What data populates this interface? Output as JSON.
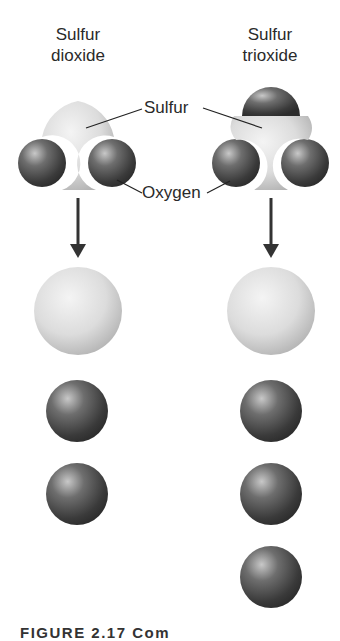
{
  "figure": {
    "molecules": [
      {
        "name_line1": "Sulfur",
        "name_line2": "dioxide",
        "sulfur_atoms": 1,
        "oxygen_atoms": 2
      },
      {
        "name_line1": "Sulfur",
        "name_line2": "trioxide",
        "sulfur_atoms": 1,
        "oxygen_atoms": 3
      }
    ],
    "labels": {
      "sulfur": "Sulfur",
      "oxygen": "Oxygen"
    },
    "caption": "FIGURE 2.17  Com"
  }
}
